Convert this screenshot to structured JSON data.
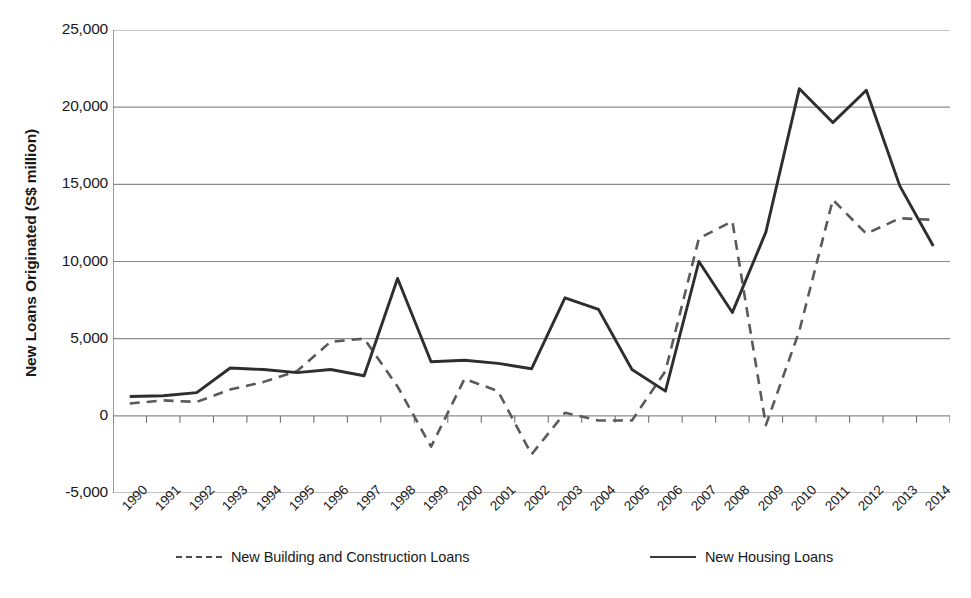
{
  "chart_data": {
    "type": "line",
    "title": "",
    "xlabel": "",
    "ylabel": "New Loans Originated (S$ million)",
    "x": [
      1990,
      1991,
      1992,
      1993,
      1994,
      1995,
      1996,
      1997,
      1998,
      1999,
      2000,
      2001,
      2002,
      2003,
      2004,
      2005,
      2006,
      2007,
      2008,
      2009,
      2010,
      2011,
      2012,
      2013,
      2014
    ],
    "categories": [
      "1990",
      "1991",
      "1992",
      "1993",
      "1994",
      "1995",
      "1996",
      "1997",
      "1998",
      "1999",
      "2000",
      "2001",
      "2002",
      "2003",
      "2004",
      "2005",
      "2006",
      "2007",
      "2008",
      "2009",
      "2010",
      "2011",
      "2012",
      "2013",
      "2014"
    ],
    "series": [
      {
        "name": "New Building and Construction Loans",
        "style": "dashed",
        "color": "#5a5a5a",
        "values": [
          800,
          1000,
          900,
          1700,
          2200,
          2900,
          4800,
          5000,
          1900,
          -2000,
          2400,
          1600,
          -2500,
          200,
          -300,
          -300,
          2900,
          11500,
          12600,
          -600,
          5500,
          14000,
          11800,
          12800,
          12700
        ]
      },
      {
        "name": "New Housing Loans",
        "style": "solid",
        "color": "#2e2e2e",
        "values": [
          1250,
          1300,
          1500,
          3100,
          3000,
          2800,
          3000,
          2600,
          8900,
          3500,
          3600,
          3400,
          3050,
          7650,
          6900,
          3000,
          1600,
          10000,
          6700,
          11900,
          21200,
          19000,
          21100,
          14900,
          11000
        ]
      }
    ],
    "ylim": [
      -5000,
      25000
    ],
    "yticks": [
      -5000,
      0,
      5000,
      10000,
      15000,
      20000,
      25000
    ],
    "ytick_labels": [
      "-5,000",
      "0",
      "5,000",
      "10,000",
      "15,000",
      "20,000",
      "25,000"
    ],
    "grid": "horizontal",
    "legend_position": "bottom"
  },
  "legend": {
    "entries": [
      {
        "label": "New Building and Construction Loans",
        "style": "dashed"
      },
      {
        "label": "New Housing Loans",
        "style": "solid"
      }
    ]
  },
  "colors": {
    "housing_line": "#2e2e2e",
    "construction_line": "#5a5a5a",
    "gridline": "#8c8c8c",
    "axis": "#707070",
    "text": "#1a1a1a",
    "background": "#ffffff"
  }
}
